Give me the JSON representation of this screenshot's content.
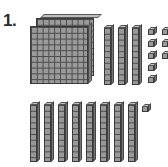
{
  "problem": {
    "number_label": "1.",
    "top_group": {
      "hundreds_flats": 2,
      "tens_rods": 3,
      "ones_units": 8,
      "unit_columns": [
        5,
        3
      ]
    },
    "bottom_group": {
      "tens_rods": 8,
      "ones_units": 1
    }
  },
  "colors": {
    "block_fill": "#9a9a9a",
    "block_outline": "#3a3a3a",
    "block_top": "#c4c4c4",
    "block_side": "#777777",
    "background": "#ffffff"
  }
}
